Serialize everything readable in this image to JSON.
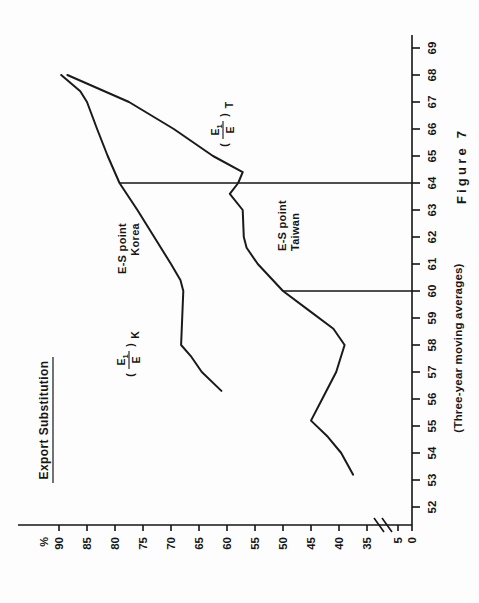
{
  "figure": {
    "title": "Export Substitution",
    "subtitle": "(Three-year moving averages)",
    "figure_number": "Figure 7",
    "y_axis_unit": "%"
  },
  "annotations": {
    "korea_marker_line1": "E-S point",
    "korea_marker_line2": "Korea",
    "taiwan_marker_line1": "E-S point",
    "taiwan_marker_line2": "Taiwan",
    "korea_curve_label_num": "E",
    "korea_curve_label_num_sub": "1",
    "korea_curve_label_den": "E",
    "korea_curve_label_suffix": "K",
    "taiwan_curve_label_num": "E",
    "taiwan_curve_label_num_sub": "1",
    "taiwan_curve_label_den": "E",
    "taiwan_curve_label_suffix": "T"
  },
  "axes": {
    "x_ticks": [
      "52",
      "53",
      "54",
      "55",
      "56",
      "57",
      "58",
      "59",
      "60",
      "61",
      "62",
      "63",
      "64",
      "65",
      "66",
      "67",
      "68",
      "69"
    ],
    "y_ticks": [
      "0",
      "5",
      "35",
      "40",
      "45",
      "50",
      "55",
      "60",
      "65",
      "70",
      "75",
      "80",
      "85",
      "90"
    ],
    "y_axis_break_between": [
      "5",
      "35"
    ],
    "x_range": [
      52,
      69
    ],
    "y_range": [
      35,
      90
    ]
  },
  "colors": {
    "ink": "#161616",
    "paper": "#fdfdfd"
  },
  "chart_data": {
    "type": "line",
    "title": "Export Substitution",
    "subtitle": "(Three-year moving averages)",
    "xlabel": "",
    "ylabel": "%",
    "xlim": [
      52,
      69
    ],
    "ylim": [
      35,
      90
    ],
    "grid": false,
    "legend": "inline-curve-labels",
    "y_axis_break": "between 5 and 35",
    "series": [
      {
        "name": "(E1/E)K",
        "label": "Korea export share",
        "x": [
          56.3,
          57.0,
          57.6,
          58.0,
          59.0,
          60.0,
          60.4,
          61.0,
          62.0,
          63.0,
          64.0,
          65.0,
          66.0,
          67.0,
          67.4,
          68.0
        ],
        "values": [
          61.0,
          64.5,
          66.5,
          68.2,
          68.0,
          67.8,
          68.3,
          70.0,
          73.0,
          76.0,
          79.2,
          81.3,
          83.2,
          85.0,
          86.2,
          89.6
        ]
      },
      {
        "name": "(E1/E)T",
        "label": "Taiwan export share",
        "x": [
          53.2,
          54.0,
          54.6,
          55.2,
          56.0,
          57.0,
          58.0,
          58.6,
          59.3,
          60.0,
          61.0,
          61.6,
          62.0,
          63.0,
          63.6,
          64.0,
          64.4,
          65.0,
          66.0,
          67.0,
          68.0
        ],
        "values": [
          37.5,
          39.6,
          42.0,
          45.0,
          43.0,
          40.5,
          39.0,
          41.0,
          45.5,
          50.0,
          54.5,
          56.5,
          57.0,
          57.2,
          59.5,
          58.0,
          57.2,
          62.5,
          69.5,
          77.5,
          88.5
        ]
      }
    ],
    "markers": [
      {
        "name": "E-S point Korea",
        "x": 64.0,
        "y_from": 35,
        "y_to": 79.2
      },
      {
        "name": "E-S point Taiwan",
        "x": 60.0,
        "y_from": 35,
        "y_to": 50.0
      }
    ]
  }
}
